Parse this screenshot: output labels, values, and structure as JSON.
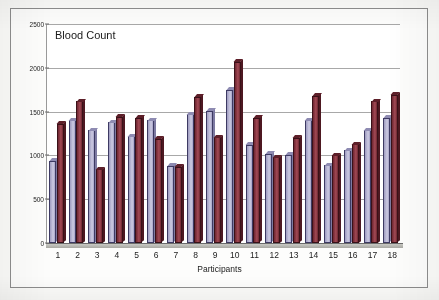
{
  "chart_data": {
    "type": "bar",
    "title": "Blood Count",
    "xlabel": "Participants",
    "ylabel": "",
    "ylim": [
      0,
      2500
    ],
    "yticks": [
      0,
      500,
      1000,
      1500,
      2000,
      2500
    ],
    "grid": true,
    "legend": "none",
    "categories": [
      "1",
      "2",
      "3",
      "4",
      "5",
      "6",
      "7",
      "8",
      "9",
      "10",
      "11",
      "12",
      "13",
      "14",
      "15",
      "16",
      "17",
      "18"
    ],
    "series": [
      {
        "name": "Series 1",
        "color": "#b9b7d4",
        "values": [
          940,
          1400,
          1290,
          1380,
          1220,
          1400,
          880,
          1470,
          1510,
          1750,
          1120,
          1020,
          1010,
          1400,
          890,
          1060,
          1290,
          1430
        ]
      },
      {
        "name": "Series 2",
        "color": "#8d3a45",
        "values": [
          1360,
          1620,
          840,
          1440,
          1430,
          1190,
          870,
          1670,
          1210,
          2070,
          1430,
          980,
          1200,
          1680,
          1000,
          1130,
          1620,
          1690
        ]
      }
    ]
  }
}
